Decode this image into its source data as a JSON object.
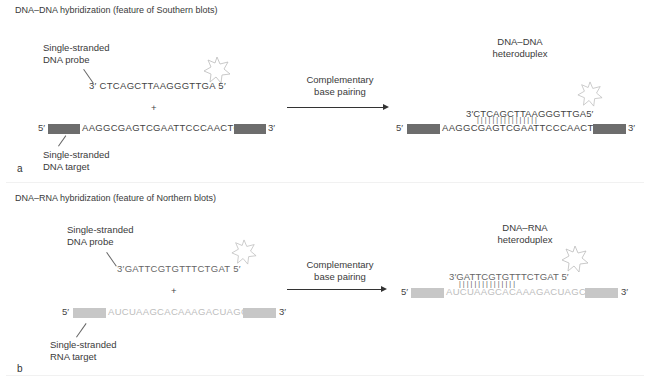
{
  "panel_a": {
    "letter": "a",
    "title": "DNA–DNA hybridization (feature of Southern blots)",
    "probe_label_line1": "Single-stranded",
    "probe_label_line2": "DNA  probe",
    "probe_seq": "3′ CTCAGCTTAAGGGTTGA 5′",
    "plus": "+",
    "target_5prime": "5′",
    "target_seq": "AAGGCGAGTCGAATTCCCAACTGAG",
    "target_3prime": "3′",
    "target_label_line1": "Single-stranded",
    "target_label_line2": "DNA target",
    "arrow_label_line1": "Complementary",
    "arrow_label_line2": "base pairing",
    "product_label_line1": "DNA–DNA",
    "product_label_line2": "heteroduplex",
    "duplex_probe_seq": "3′CTCAGCTTAAGGGTTGA5′",
    "duplex_ticks": "||||||||||||||||",
    "duplex_5prime": "5′",
    "duplex_target_seq": "AAGGCGAGTCGAATTCCCAACTGAG",
    "duplex_3prime": "3′",
    "bar_color": "#6d6d6d"
  },
  "panel_b": {
    "letter": "b",
    "title": "DNA–RNA hybridization (feature of Northern blots)",
    "probe_label_line1": "Single-stranded",
    "probe_label_line2": "DNA probe",
    "probe_seq": "3′GATTCGTGTTTCTGAT 5′",
    "plus": "+",
    "target_5prime": "5′",
    "target_seq": "AUCUAAGCACAAAGACUAGCUG",
    "target_3prime": "3′",
    "target_label_line1": "Single-stranded",
    "target_label_line2": "RNA target",
    "arrow_label_line1": "Complementary",
    "arrow_label_line2": "base pairing",
    "product_label_line1": "DNA–RNA",
    "product_label_line2": "heteroduplex",
    "duplex_probe_seq": "3′GATTCGTGTTTCTGAT 5′",
    "duplex_ticks": "|||||||||||||||",
    "duplex_5prime": "5′",
    "duplex_target_seq": "AUCUAAGCACAAAGACUAGCUG",
    "duplex_3prime": "3′",
    "bar_color": "#c7c7c7"
  },
  "icons": {
    "label_star": "star-burst (label)"
  }
}
